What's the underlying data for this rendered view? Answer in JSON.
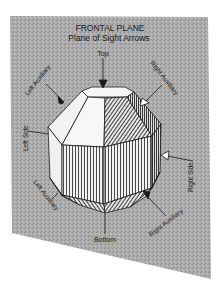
{
  "figure": {
    "plane_title": "FRONTAL PLANE",
    "plane_subtitle": "Plane of Sight Arrows",
    "colors": {
      "plane": "#a9a9a9",
      "ink": "#1a1a1a",
      "face_light": "#f4f4f4",
      "background": "#ffffff"
    }
  },
  "arrows": {
    "top": "Top",
    "bottom": "Bottom",
    "left_side": "Left Side",
    "right_side": "Right Side",
    "left_auxiliary_upper": "Left Auxiliary",
    "right_auxiliary_upper": "Right Auxiliary",
    "left_auxiliary_lower": "Left Auxiliary",
    "right_auxiliary_lower": "Right Auxiliary"
  }
}
